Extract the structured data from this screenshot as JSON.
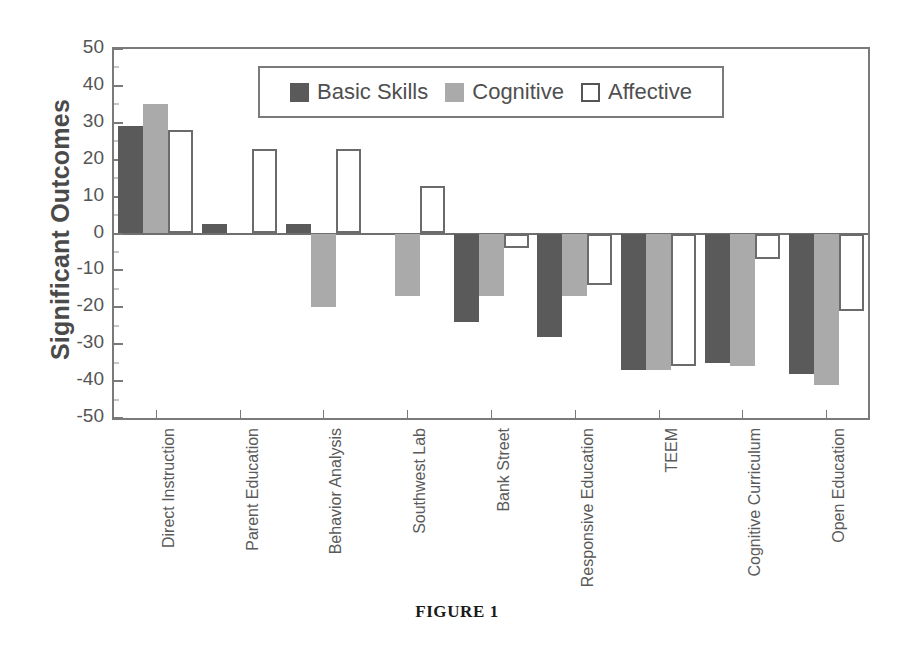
{
  "caption": "FIGURE 1",
  "legend": {
    "entries": [
      {
        "label": "Basic Skills",
        "swatch": "dark-gray-square",
        "color": "#5a5a5a"
      },
      {
        "label": "Cognitive",
        "swatch": "light-gray-square",
        "color": "#aaaaaa"
      },
      {
        "label": "Affective",
        "swatch": "white-outlined-square",
        "color": "#ffffff"
      }
    ]
  },
  "chart_data": {
    "type": "bar",
    "title": "",
    "subtitle": "",
    "xlabel": "",
    "ylabel": "Significant Outcomes",
    "ylim": [
      -50,
      50
    ],
    "yticks": [
      50,
      40,
      30,
      20,
      10,
      0,
      -10,
      -20,
      -30,
      -40,
      -50
    ],
    "ytick_labels": [
      "50",
      "40",
      "30",
      "20",
      "10",
      "0",
      "-10",
      "-20",
      "-30",
      "-40",
      "-50"
    ],
    "minor_ticks": true,
    "grid": false,
    "legend_position": "top-center-inside",
    "categories": [
      "Direct Instruction",
      "Parent Education",
      "Behavior Analysis",
      "Southwest Lab",
      "Bank Street",
      "Responsive Education",
      "TEEM",
      "Cognitive Curriculum",
      "Open Education"
    ],
    "series": [
      {
        "name": "Basic Skills",
        "color": "#5a5a5a",
        "values": [
          29,
          2.5,
          2.5,
          0,
          -24,
          -28,
          -37,
          -35,
          -38
        ]
      },
      {
        "name": "Cognitive",
        "color": "#aaaaaa",
        "values": [
          35,
          0,
          -20,
          -17,
          -17,
          -17,
          -37,
          -36,
          -41
        ]
      },
      {
        "name": "Affective",
        "color": "#ffffff",
        "values": [
          28,
          23,
          23,
          13,
          -4,
          -14,
          -36,
          -7,
          -21
        ]
      }
    ]
  }
}
